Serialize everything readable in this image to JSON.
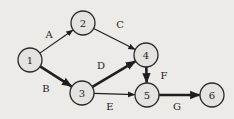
{
  "diagram": {
    "type": "activity-on-arrow network",
    "background": "#ecebe8",
    "node_radius": 12,
    "nodes": [
      {
        "id": "1",
        "label": "1",
        "x": 30,
        "y": 60
      },
      {
        "id": "2",
        "label": "2",
        "x": 83,
        "y": 23
      },
      {
        "id": "3",
        "label": "3",
        "x": 82,
        "y": 93
      },
      {
        "id": "4",
        "label": "4",
        "x": 146,
        "y": 55
      },
      {
        "id": "5",
        "label": "5",
        "x": 147,
        "y": 95
      },
      {
        "id": "6",
        "label": "6",
        "x": 212,
        "y": 95
      }
    ],
    "edges": [
      {
        "label": "A",
        "from": "1",
        "to": "2",
        "bold": false,
        "lx": 49,
        "ly": 34
      },
      {
        "label": "B",
        "from": "1",
        "to": "3",
        "bold": true,
        "lx": 46,
        "ly": 88
      },
      {
        "label": "C",
        "from": "2",
        "to": "4",
        "bold": false,
        "lx": 120,
        "ly": 24
      },
      {
        "label": "D",
        "from": "3",
        "to": "4",
        "bold": true,
        "lx": 101,
        "ly": 65
      },
      {
        "label": "E",
        "from": "3",
        "to": "5",
        "bold": false,
        "lx": 110,
        "ly": 106
      },
      {
        "label": "F",
        "from": "4",
        "to": "5",
        "bold": true,
        "lx": 164,
        "ly": 75
      },
      {
        "label": "G",
        "from": "5",
        "to": "6",
        "bold": true,
        "lx": 177,
        "ly": 106
      }
    ]
  }
}
